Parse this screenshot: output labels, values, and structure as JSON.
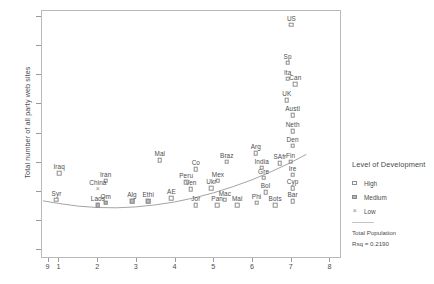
{
  "chart_data": {
    "type": "scatter",
    "title": "",
    "xlabel": "",
    "ylabel": "Total number of all party web sites",
    "xlim": [
      0.55,
      8.3
    ],
    "ylim": [
      -13,
      72
    ],
    "yticks": [
      -10,
      0,
      10,
      20,
      30,
      40,
      50,
      60,
      70
    ],
    "xticks": [
      "9",
      "1",
      "2",
      "3",
      "4",
      "5",
      "6",
      "7",
      "8"
    ],
    "xtick_values": [
      0.72,
      1,
      2,
      3,
      4,
      5,
      6,
      7,
      8
    ],
    "grid": false,
    "legend_position": "right",
    "fit_label": "Total Population",
    "rsq_label": "Rsq = 0.2190",
    "series": [
      {
        "name": "High",
        "marker": "open-square",
        "points": [
          {
            "label": "US",
            "x": 7.02,
            "y": 67.0
          },
          {
            "label": "Sp",
            "x": 6.92,
            "y": 54.0
          },
          {
            "label": "Ita",
            "x": 6.92,
            "y": 48.5
          },
          {
            "label": "Can",
            "x": 7.12,
            "y": 46.5
          },
          {
            "label": "UK",
            "x": 6.9,
            "y": 41.0
          },
          {
            "label": "Austl",
            "x": 7.05,
            "y": 36.0
          },
          {
            "label": "Neth",
            "x": 7.05,
            "y": 30.5
          },
          {
            "label": "Den",
            "x": 7.05,
            "y": 25.5
          },
          {
            "label": "Fin",
            "x": 7.0,
            "y": 20.0
          },
          {
            "label": "Ire",
            "x": 7.05,
            "y": 15.5
          },
          {
            "label": "Cyp",
            "x": 7.05,
            "y": 11.0
          },
          {
            "label": "Bar",
            "x": 7.05,
            "y": 6.5
          },
          {
            "label": "Gre",
            "x": 6.3,
            "y": 14.5
          },
          {
            "label": "SAfr",
            "x": 6.72,
            "y": 19.5
          },
          {
            "label": "Arg",
            "x": 6.1,
            "y": 23.0
          },
          {
            "label": "India",
            "x": 6.25,
            "y": 18.0
          },
          {
            "label": "Bol",
            "x": 6.35,
            "y": 9.5
          },
          {
            "label": "Phi",
            "x": 6.12,
            "y": 6.0
          },
          {
            "label": "Bots",
            "x": 6.6,
            "y": 5.0
          },
          {
            "label": "Braz",
            "x": 5.35,
            "y": 20.0
          },
          {
            "label": "Mex",
            "x": 5.12,
            "y": 13.5
          },
          {
            "label": "Co",
            "x": 4.55,
            "y": 17.5
          },
          {
            "label": "Ukr",
            "x": 4.95,
            "y": 11.0
          },
          {
            "label": "Ven",
            "x": 4.42,
            "y": 10.5
          },
          {
            "label": "Mac",
            "x": 5.3,
            "y": 7.0
          },
          {
            "label": "Mal",
            "x": 5.62,
            "y": 5.0
          },
          {
            "label": "Pan",
            "x": 5.1,
            "y": 5.0
          },
          {
            "label": "Jor",
            "x": 4.55,
            "y": 5.0
          },
          {
            "label": "Peru",
            "x": 4.3,
            "y": 13.0
          },
          {
            "label": "Mal",
            "x": 3.62,
            "y": 20.5
          },
          {
            "label": "AE",
            "x": 3.92,
            "y": 7.5
          },
          {
            "label": "Iran",
            "x": 2.22,
            "y": 13.5
          },
          {
            "label": "Iraq",
            "x": 1.02,
            "y": 16.0
          },
          {
            "label": "Syr",
            "x": 0.95,
            "y": 7.0
          }
        ]
      },
      {
        "name": "Medium",
        "marker": "filled-square",
        "points": [
          {
            "label": "Laos",
            "x": 2.02,
            "y": 5.0
          },
          {
            "label": "Om",
            "x": 2.22,
            "y": 6.0
          },
          {
            "label": "Alg",
            "x": 2.9,
            "y": 6.5
          },
          {
            "label": "Ethi",
            "x": 3.32,
            "y": 6.5
          }
        ]
      },
      {
        "name": "Low",
        "marker": "cross",
        "points": [
          {
            "label": "China",
            "x": 2.02,
            "y": 10.5
          }
        ]
      }
    ],
    "fit_curve": [
      {
        "x": 0.6,
        "y": 6.6
      },
      {
        "x": 1.0,
        "y": 5.7
      },
      {
        "x": 1.5,
        "y": 4.8
      },
      {
        "x": 2.0,
        "y": 4.3
      },
      {
        "x": 2.5,
        "y": 4.2
      },
      {
        "x": 3.0,
        "y": 4.5
      },
      {
        "x": 3.5,
        "y": 5.2
      },
      {
        "x": 4.0,
        "y": 6.2
      },
      {
        "x": 4.5,
        "y": 7.6
      },
      {
        "x": 5.0,
        "y": 9.3
      },
      {
        "x": 5.5,
        "y": 11.4
      },
      {
        "x": 6.0,
        "y": 13.8
      },
      {
        "x": 6.5,
        "y": 16.6
      },
      {
        "x": 7.0,
        "y": 19.7
      },
      {
        "x": 7.4,
        "y": 22.5
      }
    ]
  },
  "legend": {
    "title": "Level of Development",
    "items": [
      {
        "label": "High",
        "marker": "open-square"
      },
      {
        "label": "Medium",
        "marker": "filled-square"
      },
      {
        "label": "Low",
        "marker": "cross"
      }
    ],
    "fit_label": "Total Population",
    "rsq_label": "Rsq = 0.2190"
  }
}
